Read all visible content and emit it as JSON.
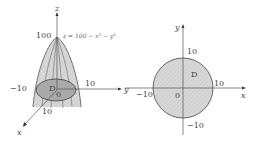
{
  "left_figure": {
    "title": "3D paraboloid over disk D",
    "axes": {
      "z": "z",
      "y": "y",
      "x": "x"
    },
    "apex_label": "100",
    "equation": "z = 100 − x² − y²",
    "region_label": "D",
    "origin_label": "0",
    "tick_labels": {
      "y_pos": "10",
      "y_neg": "−10",
      "x_pos": "10"
    }
  },
  "right_figure": {
    "title": "Disk D in xy-plane",
    "axes": {
      "x": "x",
      "y": "y"
    },
    "region_label": "D",
    "origin_label": "0",
    "tick_labels": {
      "y_pos": "10",
      "y_neg": "−10",
      "x_pos": "10",
      "x_neg": "−10"
    },
    "radius": 10
  },
  "colors": {
    "region_fill": "#cfcfcf",
    "surface_fill": "#e6e6e6",
    "stroke": "#555555",
    "text": "#444444"
  }
}
